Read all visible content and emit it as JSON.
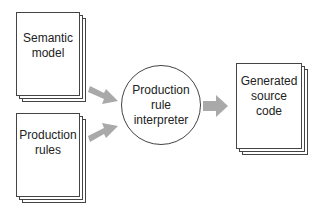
{
  "diagram": {
    "inputs": [
      {
        "id": "semantic-model",
        "label_lines": [
          "Semantic",
          "model"
        ],
        "shape": "document-stack"
      },
      {
        "id": "production-rules",
        "label_lines": [
          "Production",
          "rules"
        ],
        "shape": "document-stack"
      }
    ],
    "processor": {
      "id": "production-rule-interpreter",
      "label_lines": [
        "Production",
        "rule",
        "interpreter"
      ],
      "shape": "circle"
    },
    "output": {
      "id": "generated-source-code",
      "label_lines": [
        "Generated",
        "source",
        "code"
      ],
      "shape": "document-stack"
    },
    "edges": [
      {
        "from": "semantic-model",
        "to": "production-rule-interpreter"
      },
      {
        "from": "production-rules",
        "to": "production-rule-interpreter"
      },
      {
        "from": "production-rule-interpreter",
        "to": "generated-source-code"
      }
    ],
    "colors": {
      "arrow": "#a9a9a9",
      "stroke": "#444444",
      "background": "#ffffff"
    }
  }
}
